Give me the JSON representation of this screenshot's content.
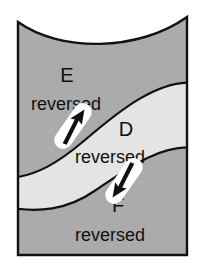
{
  "figure": {
    "background_color": "#ffffff",
    "outline_color": "#111111",
    "regions": [
      {
        "id": "E",
        "letter": "E",
        "qualifier": "reversed",
        "fill": "#ababab",
        "position": "upper"
      },
      {
        "id": "D",
        "letter": "D",
        "qualifier": "reversed",
        "fill": "#e4e4e4",
        "position": "middle-band"
      },
      {
        "id": "F",
        "letter": "F",
        "qualifier": "reversed",
        "fill": "#ababab",
        "position": "lower"
      }
    ],
    "markers": [
      {
        "id": "slip-marker-upper",
        "shape": "capsule",
        "capsule_fill": "#ffffff",
        "arrow_fill": "#101010",
        "arrow_direction": "up-left",
        "rotation_deg": 35
      },
      {
        "id": "slip-marker-lower",
        "shape": "capsule",
        "capsule_fill": "#ffffff",
        "arrow_fill": "#101010",
        "arrow_direction": "down-right",
        "rotation_deg": 35
      }
    ]
  }
}
